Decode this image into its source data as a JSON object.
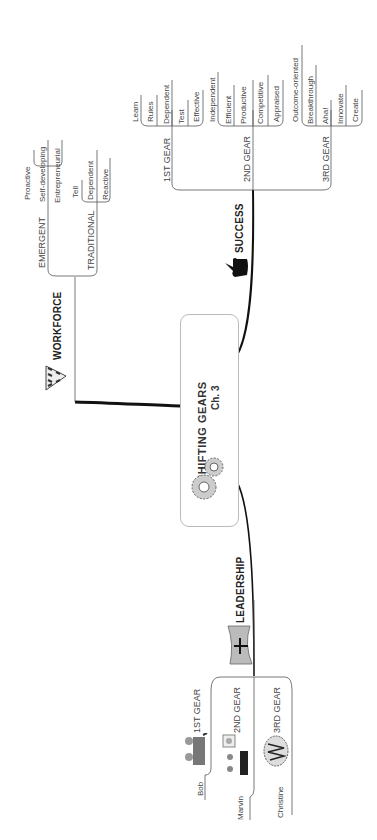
{
  "central": {
    "title": "SHIFTING  GEARS",
    "subtitle": "Ch. 3",
    "icon": "gears-icon"
  },
  "branches": {
    "workforce": {
      "label": "WORKFORCE",
      "icon": "hands-triangle-icon",
      "children": [
        {
          "label": "EMERGENT",
          "leaves": [
            "Proactive",
            "Self-developing",
            "Entrepreneurial"
          ]
        },
        {
          "label": "TRADITIONAL",
          "leaves": [
            "Tell",
            "Dependent",
            "Reactive"
          ]
        }
      ]
    },
    "success": {
      "label": "SUCCESS",
      "icon": "thumbs-up-icon",
      "children": [
        {
          "label": "1ST GEAR",
          "leaves": [
            "Learn",
            "Rules",
            "Dependent",
            "Test",
            "Effective"
          ]
        },
        {
          "label": "2ND GEAR",
          "leaves": [
            "Independent",
            "Efficient",
            "Productive",
            "Competitive",
            "Appraised"
          ]
        },
        {
          "label": "3RD GEAR",
          "leaves": [
            "Outcome-oriented",
            "Breakthrough",
            "Aha!",
            "Innovate",
            "Create"
          ]
        }
      ]
    },
    "leadership": {
      "label": "LEADERSHIP",
      "icon": "leader-podium-icon",
      "children": [
        {
          "label": "1ST GEAR",
          "person": "Bob",
          "icon": "meeting-people-icon"
        },
        {
          "label": "2ND GEAR",
          "person": "Marvin",
          "icon": "presentation-people-icon"
        },
        {
          "label": "3RD GEAR",
          "person": "Christine",
          "icon": "brainstorm-cloud-icon"
        }
      ]
    }
  }
}
